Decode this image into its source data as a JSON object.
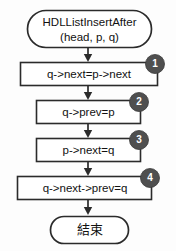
{
  "diagram": {
    "colors": {
      "background": "#fdfdfd",
      "stroke": "#2b2b2b",
      "node_fill": "#ffffff",
      "badge_fill": "#4f4f4f",
      "badge_text": "#ffffff",
      "text": "#111111"
    },
    "start_terminal": {
      "line1": "HDLListInsertAfter",
      "line2": "(head, p, q)"
    },
    "steps": [
      {
        "badge": "1",
        "text": "q->next=p->next"
      },
      {
        "badge": "2",
        "text": "q->prev=p"
      },
      {
        "badge": "3",
        "text": "p->next=q"
      },
      {
        "badge": "4",
        "text": "q->next->prev=q"
      }
    ],
    "end_terminal": {
      "label": "結束"
    }
  }
}
